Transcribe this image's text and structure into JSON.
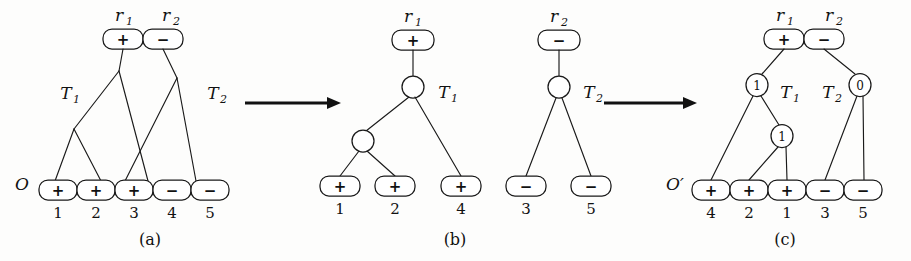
{
  "figure": {
    "background_color": "#fdfdfc",
    "ink_color": "#111111"
  },
  "panels": [
    {
      "id": "a",
      "caption": "(a)",
      "sequence_label": "O",
      "tree_labels": [
        "T₁",
        "T₂"
      ],
      "root_labels": [
        "r₁",
        "r₂"
      ],
      "roots": [
        {
          "sign": "+",
          "label": "r₁"
        },
        {
          "sign": "−",
          "label": "r₂"
        }
      ],
      "leaves": [
        {
          "sign": "+",
          "index": "1"
        },
        {
          "sign": "+",
          "index": "2"
        },
        {
          "sign": "+",
          "index": "3"
        },
        {
          "sign": "−",
          "index": "4"
        },
        {
          "sign": "−",
          "index": "5"
        }
      ],
      "internal_nodes": []
    },
    {
      "id": "b",
      "caption": "(b)",
      "sequence_label": "",
      "tree_labels": [
        "T₁",
        "T₂"
      ],
      "root_labels": [
        "r₁",
        "r₂"
      ],
      "roots": [
        {
          "sign": "+",
          "label": "r₁"
        },
        {
          "sign": "−",
          "label": "r₂"
        }
      ],
      "leaves_t1": [
        {
          "sign": "+",
          "index": "1"
        },
        {
          "sign": "+",
          "index": "2"
        },
        {
          "sign": "+",
          "index": "4"
        }
      ],
      "leaves_t2": [
        {
          "sign": "−",
          "index": "3"
        },
        {
          "sign": "−",
          "index": "5"
        }
      ],
      "internal_nodes": [
        {
          "value": ""
        },
        {
          "value": ""
        },
        {
          "value": ""
        }
      ]
    },
    {
      "id": "c",
      "caption": "(c)",
      "sequence_label": "O′",
      "tree_labels": [
        "T₁",
        "T₂"
      ],
      "root_labels": [
        "r₁",
        "r₂"
      ],
      "roots": [
        {
          "sign": "+",
          "label": "r₁"
        },
        {
          "sign": "−",
          "label": "r₂"
        }
      ],
      "leaves": [
        {
          "sign": "+",
          "index": "4"
        },
        {
          "sign": "+",
          "index": "2"
        },
        {
          "sign": "+",
          "index": "1"
        },
        {
          "sign": "−",
          "index": "3"
        },
        {
          "sign": "−",
          "index": "5"
        }
      ],
      "internal_nodes": [
        {
          "value": "1",
          "position": "t1-root"
        },
        {
          "value": "1",
          "position": "t1-child"
        },
        {
          "value": "0",
          "position": "t2-root"
        }
      ]
    }
  ],
  "arrows": [
    {
      "name": "arrow-a-to-b",
      "direction": "right"
    },
    {
      "name": "arrow-b-to-c",
      "direction": "right"
    }
  ],
  "text": {
    "sign_plus": "+",
    "sign_minus": "−",
    "T1": "T",
    "T2": "T",
    "T1_sub": "1",
    "T2_sub": "2",
    "r1": "r",
    "r2": "r",
    "r1_sub": "1",
    "r2_sub": "2",
    "O": "O",
    "Oprime": "O′",
    "caption_a": "(a)",
    "caption_b": "(b)",
    "caption_c": "(c)",
    "node_1": "1",
    "node_0": "0",
    "idx_1": "1",
    "idx_2": "2",
    "idx_3": "3",
    "idx_4": "4",
    "idx_5": "5"
  }
}
